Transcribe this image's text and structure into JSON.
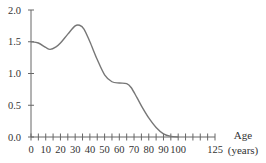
{
  "chart_data": {
    "type": "line",
    "title": "",
    "xlabel": "Age (years)",
    "xlabel_lines": [
      "Age",
      "(years)"
    ],
    "ylabel": "",
    "xlim": [
      0,
      125
    ],
    "ylim": [
      0,
      2.0
    ],
    "grid": false,
    "legend": null,
    "x_ticks_minor_step": 5,
    "x_tick_labels": [
      "0",
      "10",
      "20",
      "30",
      "40",
      "50",
      "60",
      "70",
      "80",
      "90",
      "100",
      "125"
    ],
    "x_tick_values": [
      0,
      10,
      20,
      30,
      40,
      50,
      60,
      70,
      80,
      90,
      100,
      125
    ],
    "y_tick_labels": [
      "0.0",
      "0.5",
      "1.0",
      "1.5",
      "2.0"
    ],
    "y_tick_values": [
      0.0,
      0.5,
      1.0,
      1.5,
      2.0
    ],
    "series": [
      {
        "name": "curve",
        "color": "#777777",
        "x": [
          0,
          5,
          10,
          13,
          17,
          20,
          25,
          30,
          33,
          36,
          40,
          45,
          50,
          55,
          60,
          65,
          68,
          72,
          76,
          80,
          85,
          90,
          95,
          100
        ],
        "values": [
          1.5,
          1.48,
          1.41,
          1.38,
          1.42,
          1.48,
          1.62,
          1.75,
          1.76,
          1.7,
          1.5,
          1.22,
          0.98,
          0.87,
          0.85,
          0.84,
          0.78,
          0.62,
          0.45,
          0.3,
          0.15,
          0.05,
          0.01,
          0.0
        ]
      }
    ]
  }
}
